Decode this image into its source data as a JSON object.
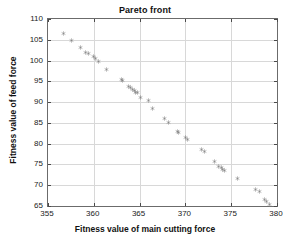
{
  "chart_data": {
    "type": "scatter",
    "title": "Pareto front",
    "xlabel": "Fitness value of main cutting force",
    "ylabel": "Fitness value of feed force",
    "xlim": [
      355,
      380
    ],
    "ylim": [
      65,
      110
    ],
    "xticks": [
      355,
      360,
      365,
      370,
      375,
      380
    ],
    "yticks": [
      65,
      70,
      75,
      80,
      85,
      90,
      95,
      100,
      105,
      110
    ],
    "grid": true,
    "legend": null,
    "marker": "hexagram",
    "marker_color": "#808080",
    "series": [
      {
        "name": "Pareto front",
        "points": [
          [
            356.7,
            106.4
          ],
          [
            357.6,
            104.9
          ],
          [
            358.6,
            103.2
          ],
          [
            359.1,
            102.0
          ],
          [
            359.4,
            101.8
          ],
          [
            360.0,
            100.9
          ],
          [
            360.2,
            100.6
          ],
          [
            360.5,
            99.7
          ],
          [
            361.4,
            97.9
          ],
          [
            363.0,
            95.4
          ],
          [
            363.1,
            95.1
          ],
          [
            363.8,
            93.7
          ],
          [
            364.0,
            93.4
          ],
          [
            364.2,
            93.1
          ],
          [
            364.4,
            92.7
          ],
          [
            364.6,
            92.4
          ],
          [
            364.8,
            92.2
          ],
          [
            365.1,
            91.2
          ],
          [
            366.0,
            90.3
          ],
          [
            366.4,
            88.5
          ],
          [
            367.7,
            86.0
          ],
          [
            368.2,
            85.2
          ],
          [
            369.1,
            83.0
          ],
          [
            369.3,
            82.6
          ],
          [
            370.0,
            81.4
          ],
          [
            370.2,
            81.1
          ],
          [
            371.8,
            78.5
          ],
          [
            372.1,
            78.2
          ],
          [
            373.2,
            75.8
          ],
          [
            373.6,
            74.6
          ],
          [
            373.9,
            74.2
          ],
          [
            374.1,
            73.8
          ],
          [
            374.3,
            73.5
          ],
          [
            375.7,
            71.5
          ],
          [
            377.7,
            69.0
          ],
          [
            378.1,
            68.4
          ],
          [
            378.6,
            66.6
          ],
          [
            378.9,
            66.0
          ],
          [
            379.2,
            65.3
          ]
        ]
      }
    ]
  },
  "axes": {
    "frame_color": "#6b6b6b",
    "grid_color": "#d8d8d8"
  }
}
